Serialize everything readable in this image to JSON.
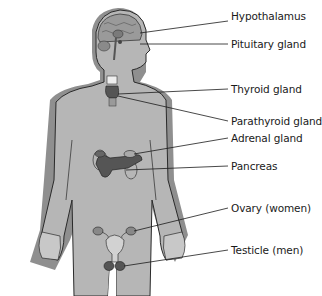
{
  "diagram": {
    "colors": {
      "body_fill": "#b4b4b4",
      "body_shadow": "#8a8a8a",
      "outline": "#2a2a2a",
      "organ_dark": "#555555",
      "leader_line": "#1a1a1a",
      "label_text": "#1a1a1a"
    },
    "labels": [
      {
        "id": "hypothalamus",
        "text": "Hypothalamus",
        "x": 231,
        "y": 16
      },
      {
        "id": "pituitary",
        "text": "Pituitary gland",
        "x": 231,
        "y": 38
      },
      {
        "id": "thyroid",
        "text": "Thyroid gland",
        "x": 231,
        "y": 84
      },
      {
        "id": "parathyroid",
        "text": "Parathyroid gland",
        "x": 231,
        "y": 116
      },
      {
        "id": "adrenal",
        "text": "Adrenal gland",
        "x": 231,
        "y": 133
      },
      {
        "id": "pancreas",
        "text": "Pancreas",
        "x": 231,
        "y": 161
      },
      {
        "id": "ovary",
        "text": "Ovary (women)",
        "x": 231,
        "y": 203
      },
      {
        "id": "testicle",
        "text": "Testicle (men)",
        "x": 231,
        "y": 245
      }
    ]
  }
}
